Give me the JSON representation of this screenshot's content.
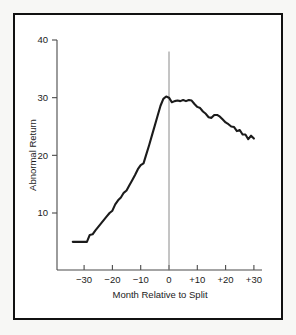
{
  "figure": {
    "background_color": "#f7f7f5",
    "panel_color": "#ffffff",
    "frame_color": "#111111",
    "line_color": "#1b1b1b",
    "axis_color": "#4a4a4a",
    "event_line_color": "#8a8a8a"
  },
  "chart_data": {
    "type": "line",
    "title": "",
    "subtitle": "",
    "xlabel": "Month Relative to Split",
    "ylabel": "Abnormal Return",
    "xlim": [
      -35,
      32
    ],
    "ylim": [
      0,
      42
    ],
    "grid": false,
    "legend": "none",
    "xticks": [
      -30,
      -20,
      -10,
      0,
      10,
      20,
      30
    ],
    "xticklabels": [
      "−30",
      "−20",
      "−10",
      "0",
      "+10",
      "+20",
      "+30"
    ],
    "yticks": [
      10,
      20,
      30,
      40
    ],
    "yticklabels": [
      "10",
      "20",
      "30",
      "40"
    ],
    "annotations": [
      {
        "name": "split-event-line",
        "type": "vline",
        "x": 0,
        "y_top": 38.0,
        "y_bottom": 0.0,
        "label": ""
      }
    ],
    "series": [
      {
        "name": "Cumulative Abnormal Return",
        "x": [
          -34,
          -33,
          -32,
          -31,
          -30,
          -29,
          -28,
          -27,
          -26,
          -25,
          -24,
          -23,
          -22,
          -21,
          -20,
          -19,
          -18,
          -17,
          -16,
          -15,
          -14,
          -13,
          -12,
          -11,
          -10,
          -9,
          -8,
          -7,
          -6,
          -5,
          -4,
          -3,
          -2,
          -1,
          0,
          1,
          2,
          3,
          4,
          5,
          6,
          7,
          8,
          9,
          10,
          11,
          12,
          13,
          14,
          15,
          16,
          17,
          18,
          19,
          20,
          21,
          22,
          23,
          24,
          25,
          26,
          27,
          28,
          29,
          30
        ],
        "values": [
          5.0,
          5.0,
          5.0,
          5.0,
          5.0,
          5.0,
          6.2,
          6.3,
          7.0,
          7.6,
          8.2,
          8.8,
          9.4,
          10.0,
          10.4,
          11.5,
          12.2,
          12.7,
          13.5,
          13.9,
          14.8,
          15.7,
          16.6,
          17.6,
          18.3,
          18.6,
          20.2,
          21.8,
          23.5,
          25.2,
          26.9,
          28.6,
          29.8,
          30.2,
          30.0,
          29.2,
          29.4,
          29.5,
          29.4,
          29.6,
          29.4,
          29.6,
          29.5,
          28.9,
          28.4,
          28.2,
          27.6,
          27.2,
          26.6,
          26.5,
          27.0,
          27.0,
          26.7,
          26.2,
          25.7,
          25.4,
          25.0,
          24.9,
          24.2,
          24.4,
          23.6,
          23.6,
          22.8,
          23.4,
          22.9
        ]
      }
    ]
  }
}
